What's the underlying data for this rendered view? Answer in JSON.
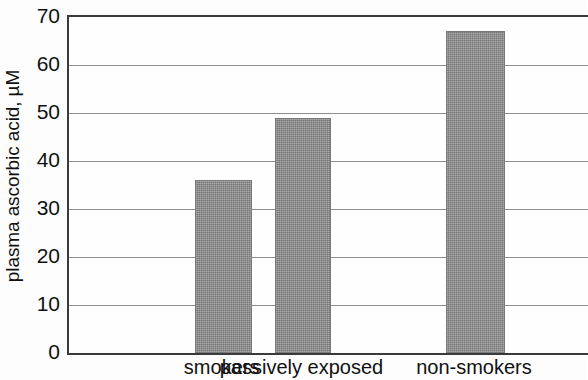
{
  "chart_data": {
    "type": "bar",
    "title": "",
    "subtitle": "",
    "xlabel": "",
    "ylabel": "plasma ascorbic acid, µM",
    "categories": [
      "smokers",
      "passively exposed",
      "non-smokers"
    ],
    "values": [
      36,
      49,
      67
    ],
    "series": [
      {
        "name": "plasma ascorbic acid",
        "values": [
          36,
          49,
          67
        ]
      }
    ],
    "ylim": [
      0,
      70
    ],
    "xlim": [
      0,
      3
    ],
    "y_ticks": [
      0,
      10,
      20,
      30,
      40,
      50,
      60,
      70
    ],
    "y_tick_labels": [
      "0",
      "10",
      "20",
      "30",
      "40",
      "50",
      "60",
      "70"
    ],
    "grid": {
      "horizontal": true,
      "vertical": false,
      "color": "#8d8d8d"
    },
    "legend": {
      "visible": false,
      "position": "none",
      "entries": []
    },
    "annotations": [],
    "colors": {
      "bar_fill": "#8e8e8e",
      "bar_edge": "#7a7a7a",
      "axis": "#3a3a3a",
      "grid": "#8d8d8d",
      "background": "#fdfdfd",
      "text": "#111111"
    },
    "bars": [
      {
        "category": "smokers",
        "value": 36,
        "center_frac": 0.298,
        "width_frac": 0.1098
      },
      {
        "category": "passively exposed",
        "value": 49,
        "center_frac": 0.4518,
        "width_frac": 0.1079
      },
      {
        "category": "non-smokers",
        "value": 67,
        "center_frac": 0.7842,
        "width_frac": 0.1137
      }
    ]
  }
}
